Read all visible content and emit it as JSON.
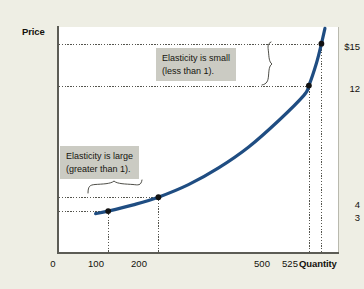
{
  "chart_data": {
    "type": "line",
    "title": "",
    "xlabel": "Quantity",
    "ylabel": "Price",
    "xlim": [
      0,
      560
    ],
    "ylim": [
      0,
      16.2
    ],
    "grid": false,
    "legend": null,
    "series": [
      {
        "name": "Demand curve",
        "color": "#1f4d82",
        "x": [
          75,
          100,
          150,
          200,
          260,
          320,
          380,
          440,
          490,
          500,
          515,
          525,
          532
        ],
        "y": [
          2.82,
          3.0,
          3.45,
          4.0,
          4.9,
          6.1,
          7.6,
          9.5,
          11.3,
          12.0,
          13.6,
          15.0,
          16.1
        ]
      }
    ],
    "points": [
      {
        "label": "(100, $3)",
        "x": 100,
        "y": 3
      },
      {
        "label": "(200, $4)",
        "x": 200,
        "y": 4
      },
      {
        "label": "(500, $12)",
        "x": 500,
        "y": 12
      },
      {
        "label": "(525, $15)",
        "x": 525,
        "y": 15
      }
    ],
    "yticks": [
      {
        "value": 15,
        "label": "$15"
      },
      {
        "value": 12,
        "label": "12"
      },
      {
        "value": 4,
        "label": "4"
      },
      {
        "value": 3,
        "label": "3"
      }
    ],
    "xticks": [
      {
        "value": 0,
        "label": "0"
      },
      {
        "value": 100,
        "label": "100"
      },
      {
        "value": 200,
        "label": "200"
      },
      {
        "value": 500,
        "label": "500"
      },
      {
        "value": 525,
        "label": "525"
      }
    ],
    "annotations": [
      {
        "name": "elasticity-small",
        "line1": "Elasticity is small",
        "line2": "(less than 1)."
      },
      {
        "name": "elasticity-large",
        "line1": "Elasticity is large",
        "line2": "(greater than 1)."
      }
    ]
  },
  "axes": {
    "y_title": "Price",
    "x_title": "Quantity"
  },
  "colors": {
    "curve": "#1f4d82",
    "background": "#eeeee4",
    "panel": "#ffffff",
    "callout_bg": "#cbcbc3",
    "axis": "#5c5c55",
    "guide": "#55554e"
  }
}
